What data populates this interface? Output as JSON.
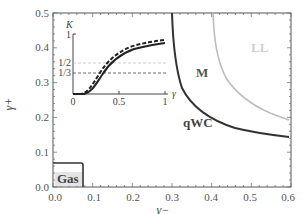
{
  "chart_data": {
    "type": "line",
    "title": "",
    "xlabel": "γ−",
    "ylabel": "γ+",
    "xlim": [
      0.0,
      0.6
    ],
    "ylim": [
      0.0,
      0.5
    ],
    "x_ticks": [
      "0.0",
      "0.1",
      "0.2",
      "0.3",
      "0.4",
      "0.5",
      "0.6"
    ],
    "y_ticks": [
      "0.0",
      "0.1",
      "0.2",
      "0.3",
      "0.4",
      "0.5"
    ],
    "grid": false,
    "series": [
      {
        "name": "qWC boundary",
        "color": "#333333",
        "x": [
          0.3,
          0.305,
          0.315,
          0.33,
          0.35,
          0.38,
          0.42,
          0.47,
          0.53,
          0.6
        ],
        "y": [
          0.5,
          0.42,
          0.34,
          0.28,
          0.235,
          0.2,
          0.178,
          0.162,
          0.151,
          0.143
        ]
      },
      {
        "name": "LL boundary",
        "color": "#bbbbbb",
        "x": [
          0.403,
          0.407,
          0.415,
          0.43,
          0.45,
          0.48,
          0.52,
          0.56,
          0.6
        ],
        "y": [
          0.5,
          0.43,
          0.37,
          0.33,
          0.29,
          0.25,
          0.22,
          0.2,
          0.19
        ]
      },
      {
        "name": "Gas boundary",
        "color": "#333333",
        "x": [
          0.0,
          0.072,
          0.075,
          0.075
        ],
        "y": [
          0.07,
          0.07,
          0.065,
          0.0
        ]
      }
    ],
    "region_labels": [
      {
        "text": "Gas",
        "x": 0.035,
        "y": 0.035
      },
      {
        "text": "qWC",
        "x": 0.33,
        "y": 0.18
      },
      {
        "text": "M",
        "x": 0.355,
        "y": 0.3
      },
      {
        "text": "LL",
        "x": 0.51,
        "y": 0.39
      }
    ],
    "inset": {
      "type": "line",
      "xlabel": "γ",
      "ylabel": "K",
      "xlim": [
        0,
        1
      ],
      "ylim": [
        0,
        1
      ],
      "x_ticks": [
        "0",
        "0.5",
        "1"
      ],
      "y_ticks": [
        "1/3",
        "1/2",
        "1"
      ],
      "reference_lines": [
        {
          "y": 0.5,
          "style": "dashed",
          "color": "#bbbbbb"
        },
        {
          "y": 0.3333,
          "style": "dashed",
          "color": "#333333"
        }
      ],
      "series": [
        {
          "name": "solid",
          "style": "solid",
          "x": [
            0,
            0.1,
            0.2,
            0.3,
            0.4,
            0.5,
            0.6,
            0.7,
            0.8,
            0.9,
            1.0
          ],
          "y": [
            0,
            0.01,
            0.12,
            0.32,
            0.5,
            0.64,
            0.74,
            0.8,
            0.84,
            0.86,
            0.87
          ]
        },
        {
          "name": "dashed",
          "style": "dashed",
          "x": [
            0,
            0.05,
            0.1,
            0.2,
            0.3,
            0.4,
            0.5,
            0.6,
            0.7,
            0.8,
            0.9,
            1.0
          ],
          "y": [
            0,
            0.01,
            0.04,
            0.2,
            0.4,
            0.57,
            0.7,
            0.79,
            0.85,
            0.89,
            0.91,
            0.93
          ]
        }
      ]
    }
  },
  "labels": {
    "xlabel": "γ−",
    "ylabel": "γ+",
    "gas": "Gas",
    "qwc": "qWC",
    "m": "M",
    "ll": "LL",
    "inset_ylabel": "K",
    "inset_xlabel": "γ",
    "inset_x0": "0",
    "inset_x05": "0.5",
    "inset_x1": "1",
    "inset_y1": "1",
    "inset_yhalf": "1/2",
    "inset_ythird": "1/3"
  },
  "x_tick_labels": [
    "0.0",
    "0.1",
    "0.2",
    "0.3",
    "0.4",
    "0.5",
    "0.6"
  ],
  "y_tick_labels": [
    "0.0",
    "0.1",
    "0.2",
    "0.3",
    "0.4",
    "0.5"
  ]
}
